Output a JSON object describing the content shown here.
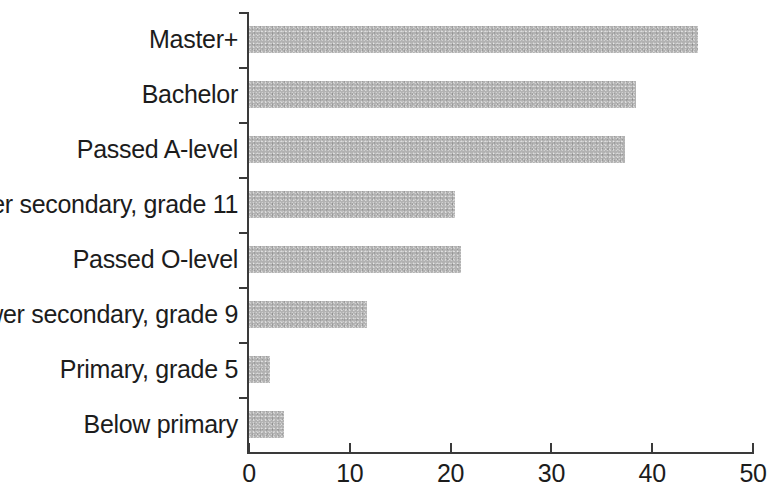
{
  "chart_data": {
    "type": "bar",
    "orientation": "horizontal",
    "title": "",
    "subtitle": "",
    "xlabel": "",
    "ylabel": "",
    "xlim": [
      0,
      50
    ],
    "ylim": null,
    "grid": false,
    "legend": null,
    "legend_position": "none",
    "bar_color": "#b2b2b2",
    "axis_color": "#3a3a3a",
    "text_color": "#1c1c1c",
    "x_ticks": [
      0,
      10,
      20,
      30,
      40,
      50
    ],
    "x_tick_labels": [
      "0",
      "10",
      "20",
      "30",
      "40",
      "50"
    ],
    "categories": [
      "Master+",
      "Bachelor",
      "Passed A-level",
      "Upper secondary, grade 11",
      "Passed O-level",
      "Lower secondary, grade 9",
      "Primary, grade 5",
      "Below primary"
    ],
    "values": [
      44.5,
      38.4,
      37.3,
      20.4,
      21.0,
      11.7,
      2.1,
      3.5
    ],
    "bars": [
      {
        "label": "Master+",
        "value": 44.5
      },
      {
        "label": "Bachelor",
        "value": 38.4
      },
      {
        "label": "Passed A-level",
        "value": 37.3
      },
      {
        "label": "Upper secondary, grade 11",
        "value": 20.4
      },
      {
        "label": "Passed O-level",
        "value": 21.0
      },
      {
        "label": "Lower secondary, grade 9",
        "value": 11.7
      },
      {
        "label": "Primary, grade 5",
        "value": 2.1
      },
      {
        "label": "Below primary",
        "value": 3.5
      }
    ]
  }
}
